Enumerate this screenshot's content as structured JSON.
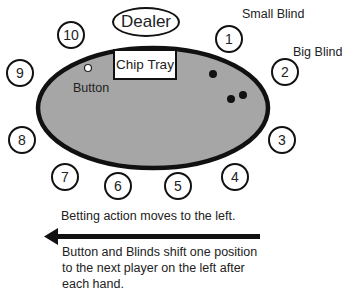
{
  "diagram": {
    "type": "poker-table-seating",
    "dealer_label": "Dealer",
    "chip_tray_label": "Chip Tray",
    "button_label": "Button",
    "small_blind_label": "Small Blind",
    "big_blind_label": "Big Blind",
    "seats": [
      {
        "number": "1",
        "role": "Small Blind"
      },
      {
        "number": "2",
        "role": "Big Blind"
      },
      {
        "number": "3"
      },
      {
        "number": "4"
      },
      {
        "number": "5"
      },
      {
        "number": "6"
      },
      {
        "number": "7"
      },
      {
        "number": "8"
      },
      {
        "number": "9"
      },
      {
        "number": "10",
        "role": "Button"
      }
    ],
    "captions": {
      "betting_action": "Betting action moves to the left.",
      "rotation": "Button and Blinds shift one position to the next player on the left after each hand."
    },
    "arrow_direction": "left",
    "colors": {
      "table_felt": "#a6a6a6",
      "table_border": "#111111",
      "background": "#ffffff"
    }
  }
}
